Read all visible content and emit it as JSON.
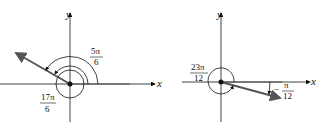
{
  "diagrams": [
    {
      "id": "left",
      "x_axis_label": "x",
      "y_axis_label": "y",
      "angle_positive_label": {
        "numerator": "5π",
        "denominator": "6"
      },
      "angle_larger_label": {
        "numerator": "17π",
        "denominator": "6"
      },
      "terminal_angle_deg": 150
    },
    {
      "id": "right",
      "x_axis_label": "x",
      "y_axis_label": "y",
      "angle_positive_label": {
        "numerator": "23π",
        "denominator": "12"
      },
      "angle_negative_label": {
        "sign": "−",
        "numerator": "π",
        "denominator": "12"
      },
      "terminal_angle_deg": -15
    }
  ],
  "colors": {
    "axis": "#111111",
    "terminal_side": "#555555",
    "initial_side": "#bbbbbb"
  }
}
